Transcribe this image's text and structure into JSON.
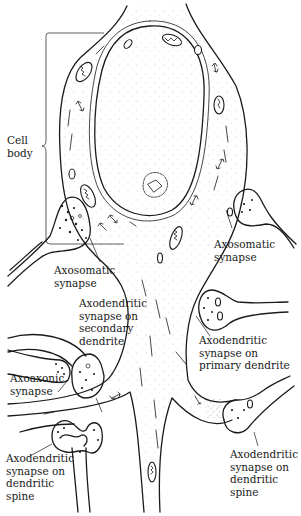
{
  "figure": {
    "colors": {
      "ink": "#1a1a1a",
      "background": "#ffffff"
    },
    "labels": {
      "cell_body": "Cell\nbody",
      "axosomatic_left": "Axosomatic\nsynapse",
      "axosomatic_right": "Axosomatic\nsynapse",
      "axodendritic_secondary": "Axodendritic\nsynapse on\nsecondary\ndendrite",
      "axodendritic_primary": "Axodendritic\nsynapse on\nprimary dendrite",
      "axoaxonic": "Axoaxonic\nsynapse",
      "axodendritic_spine_left": "Axodendritic\nsynapse on\ndendritic\nspine",
      "axodendritic_spine_right": "Axodendritic\nsynapse on\ndendritic\nspine"
    }
  }
}
